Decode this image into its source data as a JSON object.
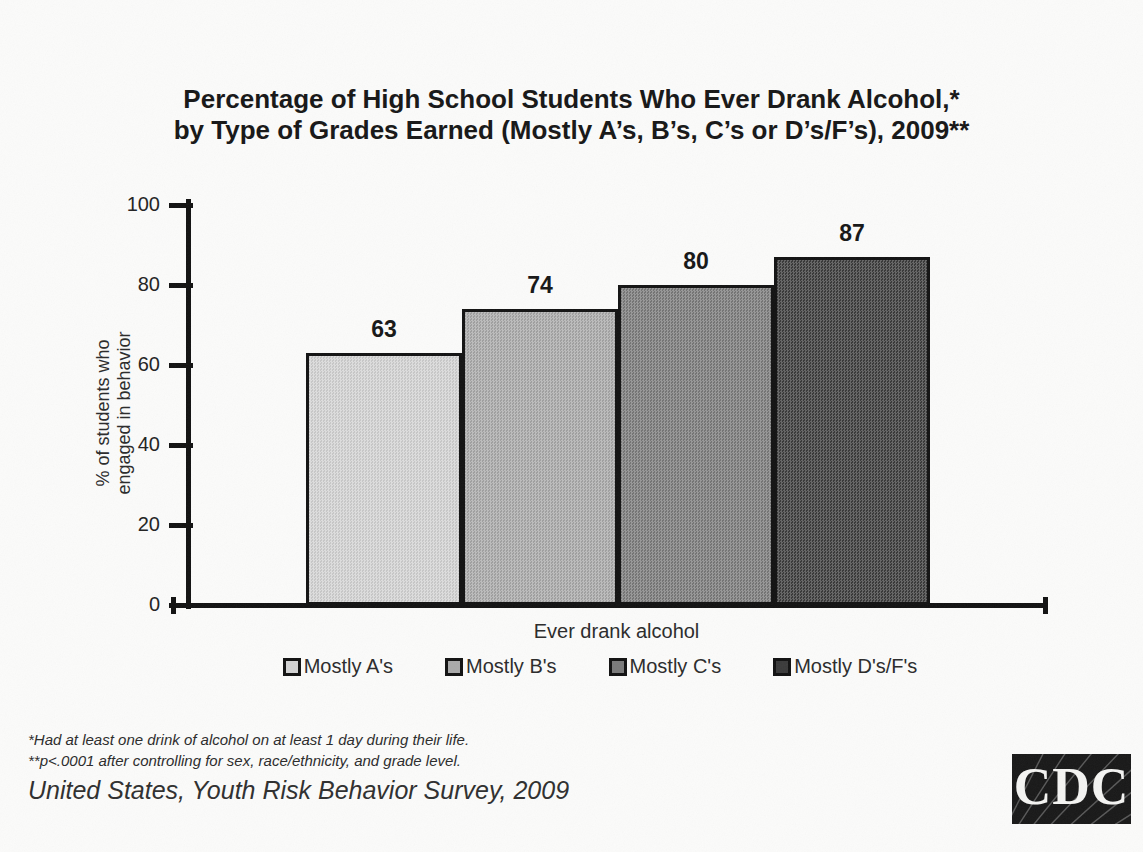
{
  "title": {
    "line1": "Percentage of High School Students Who Ever Drank Alcohol,*",
    "line2": "by Type of Grades Earned (Mostly A’s, B’s, C’s or D’s/F’s), 2009**"
  },
  "chart_data": {
    "type": "bar",
    "categories": [
      "Mostly A's",
      "Mostly B's",
      "Mostly C's",
      "Mostly D's/F's"
    ],
    "values": [
      63,
      74,
      80,
      87
    ],
    "data_labels": [
      63,
      74,
      80,
      87
    ],
    "xlabel": "Ever drank alcohol",
    "ylabel": "% of students who engaged in behavior",
    "ylabel_lines": [
      "% of students who",
      "engaged in behavior"
    ],
    "ylim": [
      0,
      100
    ],
    "yticks": [
      0,
      20,
      40,
      60,
      80,
      100
    ],
    "grid": false,
    "legend_position": "bottom",
    "legend": [
      "Mostly A's",
      "Mostly B's",
      "Mostly C's",
      "Mostly D's/F's"
    ],
    "bar_colors": [
      "#d3d3d3",
      "#a9a9a9",
      "#7a7a7a",
      "#3a3a3a"
    ],
    "axis_color": "#111111"
  },
  "footnotes": {
    "line1": "*Had at least one drink of alcohol on at least 1 day during their life.",
    "line2": "**p<.0001 after controlling for sex, race/ethnicity, and grade level."
  },
  "source": "United States, Youth Risk Behavior Survey, 2009",
  "logo": {
    "text": "CDC"
  }
}
